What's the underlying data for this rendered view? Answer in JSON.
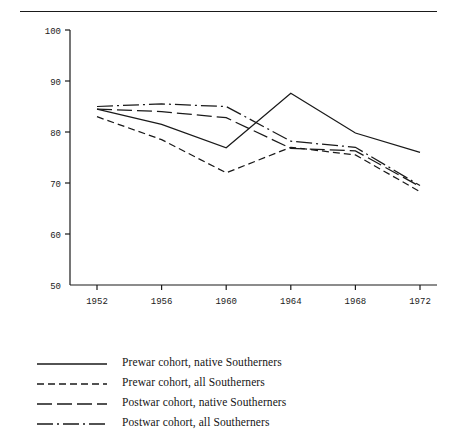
{
  "figure": {
    "has_top_rule": true,
    "background": "#ffffff",
    "line_color": "#1a1a1a"
  },
  "chart_data": {
    "type": "line",
    "title": "",
    "subtitle": "",
    "xlabel": "",
    "ylabel": "",
    "categories": [
      "1952",
      "1956",
      "1960",
      "1964",
      "1968",
      "1972"
    ],
    "x": [
      1952,
      1956,
      1960,
      1964,
      1968,
      1972
    ],
    "xlim": [
      1952,
      1972
    ],
    "ylim": [
      50,
      100
    ],
    "y_ticks": [
      50,
      60,
      70,
      80,
      90,
      100
    ],
    "x_ticks": [
      1952,
      1956,
      1960,
      1964,
      1968,
      1972
    ],
    "grid": false,
    "legend_position": "below",
    "series": [
      {
        "name": "Prewar cohort, native Southerners",
        "style": "solid",
        "values": [
          84.5,
          81.5,
          76.9,
          87.6,
          79.8,
          76.0
        ]
      },
      {
        "name": "Prewar cohort, all Southerners",
        "style": "short-dash",
        "values": [
          83.0,
          78.5,
          72.0,
          77.0,
          75.5,
          68.3
        ]
      },
      {
        "name": "Postwar cohort, native Southerners",
        "style": "long-dash",
        "values": [
          84.5,
          84.0,
          82.8,
          76.8,
          76.3,
          69.3
        ]
      },
      {
        "name": "Postwar cohort, all Southerners",
        "style": "dash-dot",
        "values": [
          85.0,
          85.5,
          85.0,
          78.2,
          77.0,
          69.5
        ]
      }
    ]
  },
  "y_axis": {
    "tick_labels": [
      "100",
      "90",
      "80",
      "70",
      "60",
      "50"
    ]
  },
  "x_axis": {
    "tick_labels": [
      "1952",
      "1956",
      "1960",
      "1964",
      "1968",
      "1972"
    ]
  },
  "legend": {
    "items": [
      {
        "label": "Prewar cohort, native Southerners",
        "style": "solid"
      },
      {
        "label": "Prewar cohort, all Southerners",
        "style": "short-dash"
      },
      {
        "label": "Postwar cohort, native Southerners",
        "style": "long-dash"
      },
      {
        "label": "Postwar cohort, all Southerners",
        "style": "dash-dot"
      }
    ]
  }
}
